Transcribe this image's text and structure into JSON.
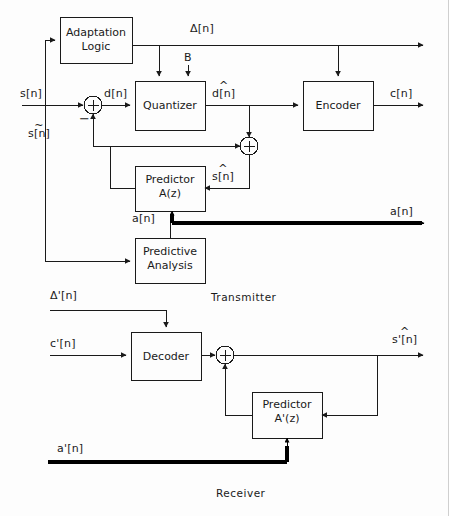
{
  "diagram": {
    "stroke_color": "#1a1a1a",
    "background_color": "#fdfdfd",
    "thick_line_color": "#000000"
  },
  "transmitter": {
    "section_label": "Transmitter",
    "blocks": [
      {
        "id": "adaptation-logic",
        "line1": "Adaptation",
        "line2": "Logic"
      },
      {
        "id": "quantizer",
        "line1": "Quantizer",
        "line2": ""
      },
      {
        "id": "encoder",
        "line1": "Encoder",
        "line2": ""
      },
      {
        "id": "predictor",
        "line1": "Predictor",
        "line2": "A(z)"
      },
      {
        "id": "predictive-analysis",
        "line1": "Predictive",
        "line2": "Analysis"
      }
    ],
    "signals": {
      "input_s": "s[n]",
      "error_d": "d[n]",
      "delta": "Δ[n]",
      "bits_B": "B",
      "quantized_d": "d[n]",
      "quantized_d_hat": "^",
      "code_c": "c[n]",
      "recon_s_tilde": "s[n]",
      "recon_s_tilde_mark": "~",
      "pred_s_hat": "s[n]",
      "pred_s_hat_mark": "^",
      "coeffs_a": "a[n]",
      "coeffs_a_out": "a[n]",
      "minus_sign": "−",
      "plus_sign": "+"
    }
  },
  "receiver": {
    "section_label": "Receiver",
    "blocks": [
      {
        "id": "decoder",
        "line1": "Decoder",
        "line2": ""
      },
      {
        "id": "predictor-prime",
        "line1": "Predictor",
        "line2": "A'(z)"
      }
    ],
    "signals": {
      "delta_prime": "Δ'[n]",
      "code_c_prime": "c'[n]",
      "output_s_hat_prime": "s'[n]",
      "output_s_hat_prime_mark": "^",
      "coeffs_a_prime": "a'[n]",
      "plus_sign": "+"
    }
  }
}
